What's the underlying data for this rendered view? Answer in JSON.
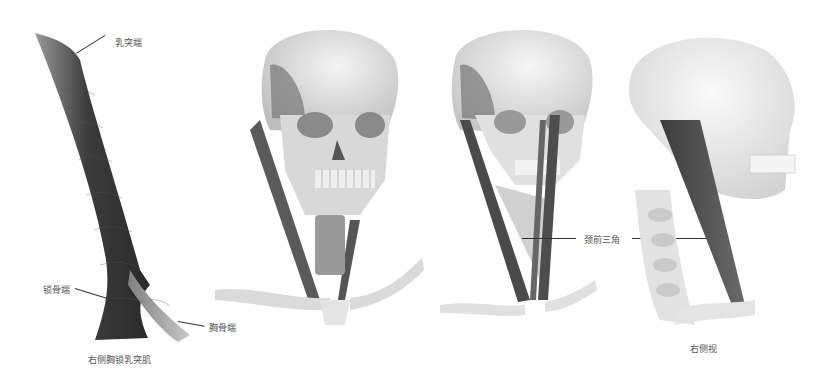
{
  "figure": {
    "panels": [
      {
        "id": "muscle-isolated",
        "caption": "右侧胸锁乳突肌",
        "labels": [
          {
            "text": "乳突端"
          },
          {
            "text": "锁骨端"
          },
          {
            "text": "胸骨端"
          }
        ]
      },
      {
        "id": "front-view-skull",
        "caption": "",
        "labels": []
      },
      {
        "id": "front-view-triangle",
        "caption": "",
        "labels": [
          {
            "text": "颈前三角"
          }
        ]
      },
      {
        "id": "right-side-view",
        "caption": "右侧视",
        "labels": []
      }
    ],
    "colors": {
      "muscle_dark": "#3a3a3a",
      "muscle_mid": "#6e6e6e",
      "bone_light": "#e6e6e6",
      "bone_shadow": "#b5b5b5",
      "text": "#555555",
      "leader": "#333333"
    }
  }
}
